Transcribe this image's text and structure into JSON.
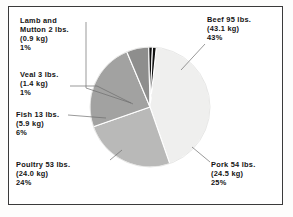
{
  "figure": {
    "background_color": "#ffffff",
    "frame_color": "#3a3a3a"
  },
  "chart_data": {
    "type": "pie",
    "title": "",
    "subtitle": "",
    "xlabel": "",
    "ylabel": "",
    "legend_position": "none",
    "grid": false,
    "label_style": "external-with-leader-lines",
    "units": {
      "primary": "lbs.",
      "secondary": "kg"
    },
    "categories": [
      "Beef",
      "Pork",
      "Poultry",
      "Fish",
      "Veal",
      "Lamb and Mutton"
    ],
    "values": [
      43,
      25,
      24,
      6,
      1,
      1
    ],
    "pounds": [
      95,
      54,
      53,
      13,
      3,
      2
    ],
    "kilograms": [
      43.1,
      24.5,
      24.0,
      5.9,
      1.4,
      0.9
    ],
    "colors": [
      "#efefee",
      "#b9b9b8",
      "#a2a2a1",
      "#8e8e8d",
      "#111111",
      "#111111"
    ],
    "slices": [
      {
        "name": "Beef",
        "percent": 43,
        "pounds": 95,
        "kilograms": 43.1,
        "color": "#efefee",
        "label_lines": [
          "Beef 95 lbs.",
          "(43.1 kg)",
          "43%"
        ]
      },
      {
        "name": "Pork",
        "percent": 25,
        "pounds": 54,
        "kilograms": 24.5,
        "color": "#b9b9b8",
        "label_lines": [
          "Pork 54 lbs.",
          "(24.5 kg)",
          "25%"
        ]
      },
      {
        "name": "Poultry",
        "percent": 24,
        "pounds": 53,
        "kilograms": 24.0,
        "color": "#a2a2a1",
        "label_lines": [
          "Poultry 53 lbs.",
          "(24.0 kg)",
          "24%"
        ]
      },
      {
        "name": "Fish",
        "percent": 6,
        "pounds": 13,
        "kilograms": 5.9,
        "color": "#8e8e8d",
        "label_lines": [
          "Fish 13 lbs.",
          "(5.9 kg)",
          "6%"
        ]
      },
      {
        "name": "Veal",
        "percent": 1,
        "pounds": 3,
        "kilograms": 1.4,
        "color": "#111111",
        "label_lines": [
          "Veal 3 lbs.",
          "(1.4 kg)",
          "1%"
        ]
      },
      {
        "name": "Lamb and Mutton",
        "percent": 1,
        "pounds": 2,
        "kilograms": 0.9,
        "color": "#111111",
        "label_lines": [
          "Lamb and",
          "Mutton 2 lbs.",
          "(0.9 kg)",
          "1%"
        ]
      }
    ]
  },
  "callouts": {
    "lamb": {
      "l1": "Lamb and",
      "l2": "Mutton 2 lbs.",
      "l3": "(0.9 kg)",
      "l4": "1%"
    },
    "veal": {
      "l1": "Veal 3 lbs.",
      "l2": "(1.4 kg)",
      "l3": "1%"
    },
    "fish": {
      "l1": "Fish 13 lbs.",
      "l2": "(5.9 kg)",
      "l3": "6%"
    },
    "poultry": {
      "l1": "Poultry 53 lbs.",
      "l2": "(24.0 kg)",
      "l3": "24%"
    },
    "beef": {
      "l1": "Beef 95 lbs.",
      "l2": "(43.1 kg)",
      "l3": "43%"
    },
    "pork": {
      "l1": "Pork 54 lbs.",
      "l2": "(24.5 kg)",
      "l3": "25%"
    }
  }
}
